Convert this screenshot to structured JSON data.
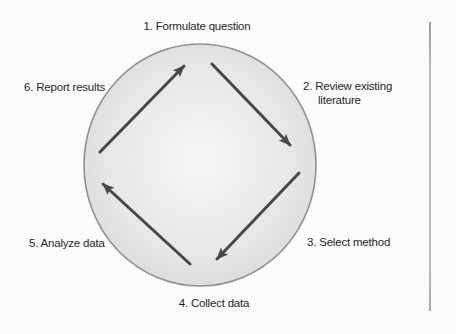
{
  "figure": {
    "name": "Research cycle",
    "steps": [
      {
        "label": "1. Formulate question"
      },
      {
        "label": "2. Review existing",
        "label_line2": "literature"
      },
      {
        "label": "3. Select method"
      },
      {
        "label": "4. Collect data"
      },
      {
        "label": "5. Analyze data"
      },
      {
        "label": "6. Report results"
      }
    ],
    "arrows": [
      {
        "name": "arrow-left-to-top",
        "direction": "up-right"
      },
      {
        "name": "arrow-top-to-right",
        "direction": "down-right"
      },
      {
        "name": "arrow-right-to-bottom",
        "direction": "down-left"
      },
      {
        "name": "arrow-bottom-to-left",
        "direction": "up-left"
      }
    ],
    "colors": {
      "background": "#fcfcfc",
      "circle_fill_center": "#f7f7f7",
      "circle_fill_edge": "#d8d8d8",
      "circle_border": "#8f8f8f",
      "arrow": "#474747",
      "text": "#1f1f1f",
      "rule_line": "#b4b4b4"
    }
  }
}
